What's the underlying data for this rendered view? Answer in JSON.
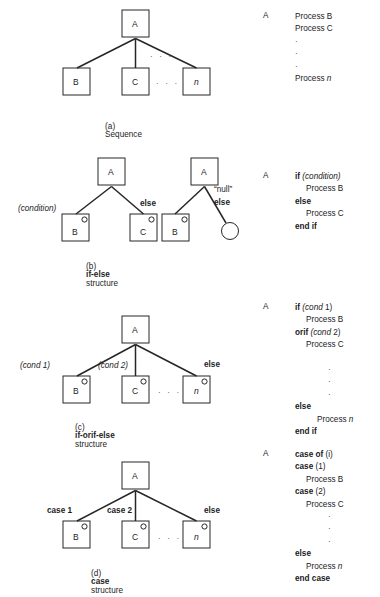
{
  "figure": {
    "colors": {
      "ink": "#1d1d1d",
      "line": "#262626",
      "paper": "#ffffff"
    }
  },
  "sections": [
    {
      "id": "a",
      "caption_prefix": "(a)",
      "caption_bold": "",
      "caption_rest": "Sequence",
      "root_label": "A",
      "children": [
        {
          "label": "B",
          "italic": false,
          "edge_label": ""
        },
        {
          "label": "C",
          "italic": false,
          "edge_label": ""
        },
        {
          "label": "n",
          "italic": true,
          "edge_label": ""
        }
      ],
      "ellipsis_upper": "· · ·",
      "ellipsis_lower": "· · ·",
      "pseudocode_key": "A",
      "pseudocode": [
        {
          "indent": 0,
          "parts": [
            {
              "t": "Process B",
              "s": "plain"
            }
          ]
        },
        {
          "indent": 0,
          "parts": [
            {
              "t": "Process C",
              "s": "plain"
            }
          ]
        },
        {
          "indent": 0,
          "parts": [
            {
              "t": "·",
              "s": "dot"
            }
          ]
        },
        {
          "indent": 0,
          "parts": [
            {
              "t": "·",
              "s": "dot"
            }
          ]
        },
        {
          "indent": 0,
          "parts": [
            {
              "t": "·",
              "s": "dot"
            }
          ]
        },
        {
          "indent": 0,
          "parts": [
            {
              "t": "Process ",
              "s": "plain"
            },
            {
              "t": "n",
              "s": "italic"
            }
          ]
        }
      ]
    },
    {
      "id": "b",
      "caption_prefix": "(b)",
      "caption_bold": "if-else",
      "caption_rest": "structure",
      "root_label": "A",
      "children": [
        {
          "label": "B",
          "italic": false,
          "edge_label": "(condition)"
        },
        {
          "label": "C",
          "italic": false,
          "edge_label": "else"
        }
      ],
      "second_tree": {
        "root_label": "A",
        "child_label": "B",
        "null_label": "“null”",
        "else_label": "else"
      },
      "pseudocode_key": "A",
      "pseudocode": [
        {
          "indent": 0,
          "parts": [
            {
              "t": "if ",
              "s": "bold"
            },
            {
              "t": "(condition)",
              "s": "italic"
            }
          ]
        },
        {
          "indent": 1,
          "parts": [
            {
              "t": "Process B",
              "s": "plain"
            }
          ]
        },
        {
          "indent": 0,
          "parts": [
            {
              "t": "else",
              "s": "bold"
            }
          ]
        },
        {
          "indent": 1,
          "parts": [
            {
              "t": "Process C",
              "s": "plain"
            }
          ]
        },
        {
          "indent": 0,
          "parts": [
            {
              "t": "end if",
              "s": "bold"
            }
          ]
        }
      ]
    },
    {
      "id": "c",
      "caption_prefix": "(c)",
      "caption_bold": "if-orif-else",
      "caption_rest": "structure",
      "root_label": "A",
      "children": [
        {
          "label": "B",
          "italic": false,
          "edge_label": "(cond 1)"
        },
        {
          "label": "C",
          "italic": false,
          "edge_label": "(cond 2)"
        },
        {
          "label": "n",
          "italic": true,
          "edge_label": "else"
        }
      ],
      "ellipsis_lower": "· · ·",
      "pseudocode_key": "A",
      "pseudocode": [
        {
          "indent": 0,
          "parts": [
            {
              "t": "if ",
              "s": "bold"
            },
            {
              "t": "(cond",
              "s": "italic"
            },
            {
              "t": " 1)",
              "s": "plain"
            }
          ]
        },
        {
          "indent": 1,
          "parts": [
            {
              "t": "Process B",
              "s": "plain"
            }
          ]
        },
        {
          "indent": 0,
          "parts": [
            {
              "t": "orif ",
              "s": "bold"
            },
            {
              "t": "(cond",
              "s": "italic"
            },
            {
              "t": " 2)",
              "s": "plain"
            }
          ]
        },
        {
          "indent": 1,
          "parts": [
            {
              "t": "Process C",
              "s": "plain"
            }
          ]
        },
        {
          "indent": 0,
          "parts": [
            {
              "t": "",
              "s": "plain"
            }
          ]
        },
        {
          "indent": 3,
          "parts": [
            {
              "t": "·",
              "s": "dot"
            }
          ]
        },
        {
          "indent": 3,
          "parts": [
            {
              "t": "·",
              "s": "dot"
            }
          ]
        },
        {
          "indent": 3,
          "parts": [
            {
              "t": "·",
              "s": "dot"
            }
          ]
        },
        {
          "indent": 0,
          "parts": [
            {
              "t": "else",
              "s": "bold"
            }
          ]
        },
        {
          "indent": 2,
          "parts": [
            {
              "t": "Process ",
              "s": "plain"
            },
            {
              "t": "n",
              "s": "italic"
            }
          ]
        },
        {
          "indent": 0,
          "parts": [
            {
              "t": "end if",
              "s": "bold"
            }
          ]
        }
      ]
    },
    {
      "id": "d",
      "caption_prefix": "(d)",
      "caption_bold": "case",
      "caption_rest": "structure",
      "root_label": "A",
      "children": [
        {
          "label": "B",
          "italic": false,
          "edge_label": "case 1"
        },
        {
          "label": "C",
          "italic": false,
          "edge_label": "case 2"
        },
        {
          "label": "n",
          "italic": true,
          "edge_label": "else"
        }
      ],
      "ellipsis_lower": "· · ·",
      "pseudocode_key": "A",
      "pseudocode": [
        {
          "indent": 0,
          "parts": [
            {
              "t": "case of ",
              "s": "bold"
            },
            {
              "t": "(i)",
              "s": "plain"
            }
          ]
        },
        {
          "indent": 0,
          "parts": [
            {
              "t": "case ",
              "s": "bold"
            },
            {
              "t": "(1)",
              "s": "plain"
            }
          ]
        },
        {
          "indent": 1,
          "parts": [
            {
              "t": "Process B",
              "s": "plain"
            }
          ]
        },
        {
          "indent": 0,
          "parts": [
            {
              "t": "case ",
              "s": "bold"
            },
            {
              "t": "(2)",
              "s": "plain"
            }
          ]
        },
        {
          "indent": 1,
          "parts": [
            {
              "t": "Process C",
              "s": "plain"
            }
          ]
        },
        {
          "indent": 3,
          "parts": [
            {
              "t": "·",
              "s": "dot"
            }
          ]
        },
        {
          "indent": 3,
          "parts": [
            {
              "t": "·",
              "s": "dot"
            }
          ]
        },
        {
          "indent": 3,
          "parts": [
            {
              "t": "·",
              "s": "dot"
            }
          ]
        },
        {
          "indent": 0,
          "parts": [
            {
              "t": "else",
              "s": "bold"
            }
          ]
        },
        {
          "indent": 1,
          "parts": [
            {
              "t": "Process ",
              "s": "plain"
            },
            {
              "t": "n",
              "s": "italic"
            }
          ]
        },
        {
          "indent": 0,
          "parts": [
            {
              "t": "end case",
              "s": "bold"
            }
          ]
        }
      ]
    }
  ]
}
